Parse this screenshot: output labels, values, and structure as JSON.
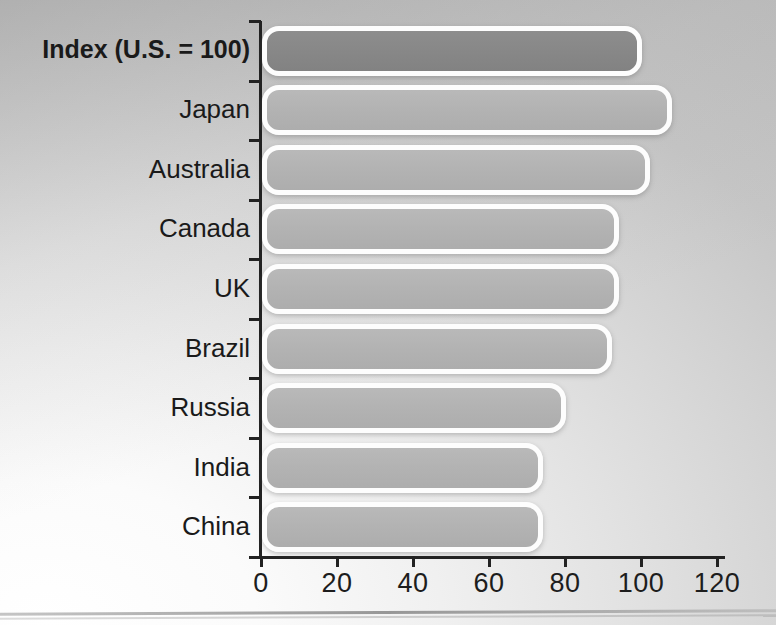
{
  "chart_data": {
    "type": "bar",
    "orientation": "horizontal",
    "title": "",
    "subtitle": "",
    "xlabel": "",
    "ylabel": "",
    "categories": [
      "Index (U.S. = 100)",
      "Japan",
      "Australia",
      "Canada",
      "UK",
      "Brazil",
      "Russia",
      "India",
      "China"
    ],
    "values": [
      100,
      108,
      102,
      94,
      94,
      92,
      80,
      74,
      74
    ],
    "bar_styles": [
      "dark",
      "light",
      "light",
      "light",
      "light",
      "light",
      "light",
      "light",
      "light"
    ],
    "xlim": [
      0,
      126
    ],
    "xticks": [
      0,
      20,
      40,
      60,
      80,
      100,
      120
    ],
    "xticklabels": [
      "0",
      "20",
      "40",
      "60",
      "80",
      "100",
      "120"
    ],
    "grid": false,
    "legend": null,
    "annotations": [],
    "colors": {
      "bar_light": "#b3b3b3",
      "bar_dark": "#888888",
      "bar_outline": "#fdfdfd",
      "axis": "#222222",
      "text": "#1a1a1a",
      "background_light": "#ffffff",
      "background_dark": "#bfbfbf"
    }
  }
}
